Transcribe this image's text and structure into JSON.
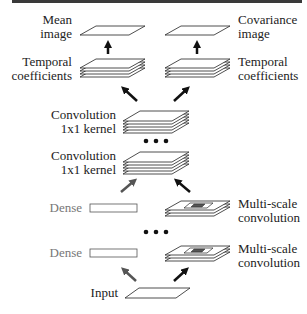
{
  "diagram": {
    "title": "",
    "nodes": {
      "mean_image": {
        "line1": "Mean",
        "line2": "image"
      },
      "covariance_image": {
        "line1": "Covariance",
        "line2": "image"
      },
      "temporal_left": {
        "line1": "Temporal",
        "line2": "coefficients"
      },
      "temporal_right": {
        "line1": "Temporal",
        "line2": "coefficients"
      },
      "conv1": {
        "line1": "Convolution",
        "line2": "1x1 kernel"
      },
      "conv2": {
        "line1": "Convolution",
        "line2": "1x1 kernel"
      },
      "dense1": {
        "label": "Dense"
      },
      "dense2": {
        "label": "Dense"
      },
      "multiscale1": {
        "line1": "Multi-scale",
        "line2": "convolution"
      },
      "multiscale2": {
        "line1": "Multi-scale",
        "line2": "convolution"
      },
      "input": {
        "label": "Input"
      }
    },
    "edges": [
      {
        "from": "input",
        "to": "dense2",
        "style": "gray-arrow"
      },
      {
        "from": "input",
        "to": "multiscale2",
        "style": "black-arrow"
      },
      {
        "from": "dense1",
        "to": "conv2",
        "style": "gray-arrow"
      },
      {
        "from": "multiscale1",
        "to": "conv2",
        "style": "black-arrow"
      },
      {
        "from": "conv1",
        "to": "temporal_left",
        "style": "black-arrow"
      },
      {
        "from": "conv1",
        "to": "temporal_right",
        "style": "black-arrow"
      },
      {
        "from": "temporal_left",
        "to": "mean_image",
        "style": "black-arrow"
      },
      {
        "from": "temporal_right",
        "to": "covariance_image",
        "style": "black-arrow"
      }
    ],
    "ellipsis": [
      "between conv layers",
      "between dense/multi-scale layers"
    ],
    "colors": {
      "line": "#222222",
      "gray_arrow": "#555555",
      "dense_text": "#777777",
      "top_bar": "#3a3a3a"
    }
  }
}
